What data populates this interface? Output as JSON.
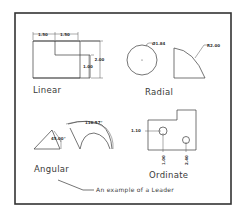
{
  "drawing": {
    "title": "Dimension types",
    "sections": {
      "linear": {
        "label": "Linear",
        "dims": {
          "top_left": "1.50",
          "top_right": "1.50",
          "right_outer": "2.00",
          "right_inner": "1.00"
        }
      },
      "radial": {
        "label": "Radial",
        "dims": {
          "diameter": "Ø1.84",
          "radius": "R2.00"
        }
      },
      "angular": {
        "label": "Angular",
        "dims": {
          "small_angle": "45.00°",
          "large_angle": "116.57°"
        }
      },
      "ordinate": {
        "label": "Ordinate",
        "dims": {
          "horizontal": "1.10",
          "vertical_left": "1.00",
          "vertical_right": "2.40"
        }
      }
    },
    "leader": {
      "text": "An example of a Leader"
    },
    "colors": {
      "line": "#3a3a3a",
      "frame": "#333333",
      "background": "#ffffff"
    }
  }
}
